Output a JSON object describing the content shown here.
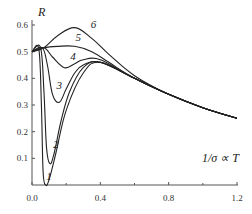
{
  "chart_data": {
    "type": "line",
    "title": "",
    "xlabel": "1/σ ∝ T",
    "ylabel": "R",
    "xlim": [
      0.0,
      1.2
    ],
    "ylim": [
      0.0,
      0.6
    ],
    "x_ticks": [
      "0.0",
      "0.4",
      "0.8",
      "1.2"
    ],
    "y_ticks": [
      "0.1",
      "0.2",
      "0.3",
      "0.4",
      "0.5",
      "0.6"
    ],
    "grid": false,
    "legend": "inline curve labels",
    "series": [
      {
        "name": "1",
        "x": [
          0.0,
          0.04,
          0.055,
          0.065,
          0.08,
          0.1,
          0.14,
          0.2,
          0.3,
          0.4,
          0.6,
          0.8,
          1.0,
          1.2
        ],
        "y": [
          0.5,
          0.51,
          0.3,
          0.05,
          0.0,
          0.02,
          0.12,
          0.28,
          0.42,
          0.46,
          0.4,
          0.34,
          0.29,
          0.25
        ]
      },
      {
        "name": "2",
        "x": [
          0.0,
          0.05,
          0.07,
          0.085,
          0.105,
          0.13,
          0.17,
          0.22,
          0.3,
          0.4,
          0.6,
          0.8,
          1.0,
          1.2
        ],
        "y": [
          0.5,
          0.515,
          0.35,
          0.14,
          0.08,
          0.12,
          0.24,
          0.35,
          0.44,
          0.46,
          0.4,
          0.34,
          0.29,
          0.25
        ]
      },
      {
        "name": "3",
        "x": [
          0.0,
          0.06,
          0.09,
          0.12,
          0.16,
          0.2,
          0.25,
          0.3,
          0.4,
          0.6,
          0.8,
          1.0,
          1.2
        ],
        "y": [
          0.5,
          0.515,
          0.45,
          0.34,
          0.31,
          0.36,
          0.42,
          0.45,
          0.46,
          0.4,
          0.34,
          0.29,
          0.25
        ]
      },
      {
        "name": "4",
        "x": [
          0.0,
          0.07,
          0.12,
          0.19,
          0.25,
          0.3,
          0.4,
          0.6,
          0.8,
          1.0,
          1.2
        ],
        "y": [
          0.5,
          0.515,
          0.48,
          0.44,
          0.455,
          0.47,
          0.47,
          0.4,
          0.34,
          0.29,
          0.25
        ]
      },
      {
        "name": "5",
        "x": [
          0.0,
          0.07,
          0.15,
          0.25,
          0.35,
          0.45,
          0.6,
          0.8,
          1.0,
          1.2
        ],
        "y": [
          0.5,
          0.515,
          0.52,
          0.52,
          0.5,
          0.46,
          0.4,
          0.34,
          0.29,
          0.25
        ]
      },
      {
        "name": "6",
        "x": [
          0.0,
          0.07,
          0.15,
          0.25,
          0.35,
          0.45,
          0.6,
          0.8,
          1.0,
          1.2
        ],
        "y": [
          0.5,
          0.515,
          0.56,
          0.59,
          0.55,
          0.49,
          0.41,
          0.34,
          0.29,
          0.25
        ]
      }
    ],
    "annotations": [
      {
        "text": "1",
        "x": 0.1,
        "y": 0.02
      },
      {
        "text": "2",
        "x": 0.14,
        "y": 0.14
      },
      {
        "text": "3",
        "x": 0.16,
        "y": 0.36
      },
      {
        "text": "4",
        "x": 0.24,
        "y": 0.47
      },
      {
        "text": "5",
        "x": 0.27,
        "y": 0.54
      },
      {
        "text": "6",
        "x": 0.36,
        "y": 0.59
      }
    ]
  },
  "axes": {
    "y_title": "R",
    "x_title": "1/σ ∝ T"
  }
}
